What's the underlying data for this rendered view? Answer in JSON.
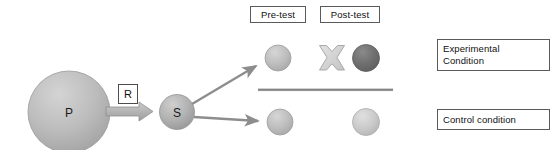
{
  "diagram": {
    "type": "experimental-design-flow",
    "background_color": "#ffffff",
    "nodes": {
      "population": {
        "letter": "P",
        "shape": "circle",
        "fill": "#b5b5b5"
      },
      "sample": {
        "letter": "S",
        "shape": "circle",
        "fill": "#a8a8a8"
      },
      "randomization": {
        "letter": "R",
        "shape": "box"
      }
    },
    "labels": {
      "pretest": "Pre-test",
      "posttest": "Post-test",
      "experimental_condition": "Experimental Condition",
      "experimental_condition_line1": "Experimental",
      "experimental_condition_line2": "Condition",
      "control_condition": "Control condition"
    },
    "measures": {
      "experimental_pretest": {
        "name": "pretest-circle-experimental",
        "fill": "#b0b0b0"
      },
      "treatment": {
        "name": "treatment-x-symbol",
        "glyph": "X",
        "fill": "#d2d2d2"
      },
      "experimental_posttest": {
        "name": "posttest-circle-experimental",
        "fill": "#6e6e6e"
      },
      "control_pretest": {
        "name": "pretest-circle-control",
        "fill": "#b0b0b0"
      },
      "control_posttest": {
        "name": "posttest-circle-control",
        "fill": "#c0c0c0"
      }
    },
    "connectors": {
      "block_arrow": "population-to-sample-arrow",
      "branch_upper": "sample-to-experimental-arrow",
      "branch_lower": "sample-to-control-arrow",
      "divider": "condition-divider-line"
    },
    "colors": {
      "line": "#8a8a8a",
      "dark_circle": "#6e6e6e",
      "light_circle": "#b0b0b0",
      "divider": "#909090",
      "border": "#5a5a5a",
      "text": "#111111"
    }
  }
}
